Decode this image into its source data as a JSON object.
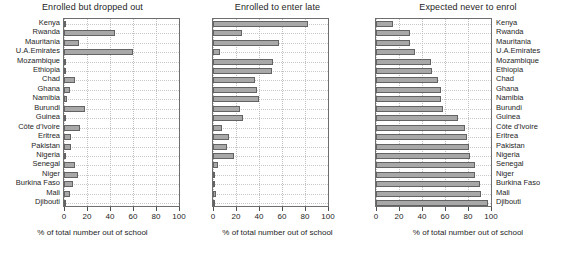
{
  "figure": {
    "width": 566,
    "height": 263,
    "background": "#ffffff",
    "bar_fill": "#a8a8a8",
    "bar_stroke": "#636363",
    "grid_color": "#c0c0c0",
    "axis_color": "#6e6e6e"
  },
  "chart_data": {
    "type": "bar",
    "orientation": "horizontal",
    "title": "",
    "xlabel": "% of total number out of school",
    "ylabel": "",
    "xlim": [
      0,
      100
    ],
    "xticks": [
      0,
      20,
      40,
      60,
      80,
      100
    ],
    "xticklabels": [
      "0",
      "20",
      "40",
      "60",
      "80",
      "100"
    ],
    "grid": true,
    "legend": "none",
    "categories": [
      "Kenya",
      "Rwanda",
      "Mauritania",
      "U.A.Emirates",
      "Mozambique",
      "Ethiopia",
      "Chad",
      "Ghana",
      "Namibia",
      "Burundi",
      "Guinea",
      "Côte d'Ivoire",
      "Eritrea",
      "Pakistan",
      "Nigeria",
      "Senegal",
      "Niger",
      "Burkina Faso",
      "Mali",
      "Djibouti"
    ],
    "panels": [
      {
        "label": "Enrolled but dropped out",
        "values": [
          1.5,
          44.5,
          13.0,
          60.0,
          0.5,
          0.5,
          9.5,
          5.0,
          3.0,
          18.5,
          1.5,
          14.0,
          6.5,
          6.5,
          0.5,
          9.5,
          12.5,
          8.0,
          5.0,
          1.0
        ]
      },
      {
        "label": "Enrolled to enter late",
        "values": [
          83.0,
          25.5,
          57.0,
          6.5,
          52.5,
          51.5,
          36.5,
          38.5,
          40.0,
          23.5,
          26.0,
          8.0,
          14.0,
          12.5,
          18.5,
          4.0,
          2.0,
          1.5,
          3.0,
          2.0
        ]
      },
      {
        "label": "Expected never to enrol",
        "values": [
          15.0,
          29.5,
          29.5,
          33.5,
          47.5,
          49.0,
          54.0,
          56.5,
          56.5,
          58.5,
          71.5,
          77.0,
          79.5,
          81.0,
          82.0,
          86.0,
          86.0,
          90.0,
          91.5,
          97.0
        ]
      }
    ]
  }
}
